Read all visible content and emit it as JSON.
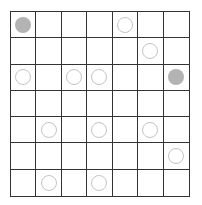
{
  "board": {
    "rows": 7,
    "cols": 7,
    "colors": {
      "line": "#333333",
      "filled": "#b3b3b3",
      "outline": "#c4c4c4"
    },
    "cells": [
      [
        "filled",
        "",
        "",
        "",
        "outline",
        "",
        ""
      ],
      [
        "",
        "",
        "",
        "",
        "",
        "outline",
        ""
      ],
      [
        "outline",
        "",
        "outline",
        "outline",
        "",
        "",
        "filled"
      ],
      [
        "",
        "",
        "",
        "",
        "",
        "",
        ""
      ],
      [
        "",
        "outline",
        "",
        "outline",
        "",
        "outline",
        ""
      ],
      [
        "",
        "",
        "",
        "",
        "",
        "",
        "outline"
      ],
      [
        "",
        "outline",
        "",
        "outline",
        "",
        "",
        ""
      ]
    ]
  }
}
